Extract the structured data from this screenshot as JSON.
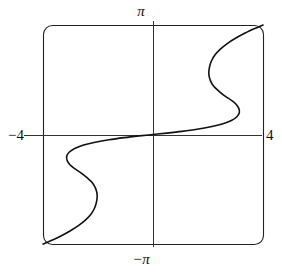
{
  "figure": {
    "kind": "cartesian-plot",
    "background": "#ffffff",
    "ink_color": "#111111",
    "frame": {
      "x_min_px": 43,
      "x_max_px": 263,
      "y_min_px": 25,
      "y_max_px": 244,
      "corner_radius_px": 9,
      "stroke_width": 1.1,
      "color": "#222222"
    },
    "origin_px": {
      "x": 153,
      "y": 135
    },
    "axes": {
      "x_axis_y_px": 135,
      "y_axis_x_px": 153,
      "stroke_width": 1.0,
      "color": "#333333"
    }
  },
  "labels": {
    "top": "π",
    "bottom": "−π",
    "left": "−4",
    "right": "4"
  },
  "chart_data": {
    "type": "line",
    "title": "",
    "xlabel": "",
    "ylabel": "",
    "xlim": [
      -4,
      4
    ],
    "ylim": [
      -3.14159,
      3.14159
    ],
    "xticks": [
      -4,
      4
    ],
    "xticklabels": [
      "−4",
      "4"
    ],
    "yticks": [
      -3.14159,
      3.14159
    ],
    "yticklabels": [
      "−π",
      "π"
    ],
    "grid": false,
    "legend": null,
    "axes_through_origin": true,
    "frame_visible": true,
    "series": [
      {
        "name": "curve",
        "description": "Sideways oscillating S-curve, 180-degree rotationally symmetric about the origin, running from the lower-left corner to the upper-right corner.",
        "color": "#111111",
        "line_width": 1.6,
        "orientation": "x-as-function-of-y",
        "x": [
          -4.0,
          -3.7,
          -3.35,
          -3.0,
          -2.7,
          -2.45,
          -2.25,
          -2.12,
          -2.05,
          -2.03,
          -2.08,
          -2.2,
          -2.4,
          -2.62,
          -2.85,
          -3.02,
          -3.12,
          -3.14,
          -3.05,
          -2.85,
          -2.52,
          -2.1,
          -1.6,
          -1.05,
          -0.5,
          0.0,
          0.5,
          1.05,
          1.6,
          2.1,
          2.52,
          2.85,
          3.05,
          3.14,
          3.12,
          3.02,
          2.85,
          2.62,
          2.4,
          2.2,
          2.08,
          2.03,
          2.05,
          2.12,
          2.25,
          2.45,
          2.7,
          3.0,
          3.35,
          3.7,
          4.0
        ],
        "y": [
          -3.1416,
          -3.04,
          -2.91,
          -2.76,
          -2.61,
          -2.45,
          -2.28,
          -2.1,
          -1.92,
          -1.74,
          -1.56,
          -1.39,
          -1.24,
          -1.1,
          -0.98,
          -0.87,
          -0.75,
          -0.63,
          -0.51,
          -0.4,
          -0.3,
          -0.22,
          -0.15,
          -0.09,
          -0.04,
          0.0,
          0.04,
          0.09,
          0.15,
          0.22,
          0.3,
          0.4,
          0.51,
          0.63,
          0.75,
          0.87,
          0.98,
          1.1,
          1.24,
          1.39,
          1.56,
          1.74,
          1.92,
          2.1,
          2.28,
          2.45,
          2.61,
          2.76,
          2.91,
          3.04,
          3.1416
        ],
        "extrema_px": [
          {
            "role": "local-min-x-upper",
            "x_px": 162,
            "y_px": 48
          },
          {
            "role": "local-max-x-upper",
            "x_px": 250,
            "y_px": 83
          },
          {
            "role": "local-min-x-middle",
            "x_px": 105,
            "y_px": 118
          },
          {
            "role": "local-max-x-middle",
            "x_px": 196,
            "y_px": 152
          },
          {
            "role": "local-min-x-lower",
            "x_px": 51,
            "y_px": 190
          },
          {
            "role": "local-max-x-lower",
            "x_px": 139,
            "y_px": 225
          }
        ],
        "endpoints_px": [
          {
            "role": "start-bottom-left",
            "x_px": 44,
            "y_px": 243
          },
          {
            "role": "end-top-right",
            "x_px": 262,
            "y_px": 26
          }
        ],
        "passes_through_origin": true
      }
    ]
  }
}
